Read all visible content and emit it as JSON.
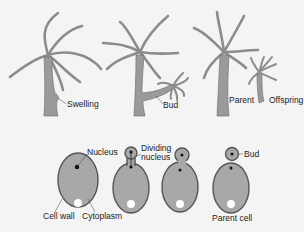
{
  "colors": {
    "background": "#f4f4f4",
    "body_fill": "#9a9a9a",
    "body_stroke": "#5a5a5a",
    "tentacle": "#8c8c8c",
    "cell_fill": "#a8a8a8",
    "cell_stroke": "#555555",
    "nucleus": "#111111",
    "vacuole": "#ffffff",
    "label_text": "#222222"
  },
  "hydra_panel": {
    "stages": [
      {
        "id": "stage-1",
        "label": "Swelling"
      },
      {
        "id": "stage-2",
        "label": "Bud"
      },
      {
        "id": "stage-3a",
        "label": "Parent"
      },
      {
        "id": "stage-3b",
        "label": "Offspring"
      }
    ]
  },
  "yeast_panel": {
    "labels": {
      "nucleus": "Nucleus",
      "dividing_nucleus_line1": "Dividing",
      "dividing_nucleus_line2": "nucleus",
      "bud": "Bud",
      "cell_wall": "Cell wall",
      "cytoplasm": "Cytoplasm",
      "parent_cell": "Parent cell"
    }
  }
}
